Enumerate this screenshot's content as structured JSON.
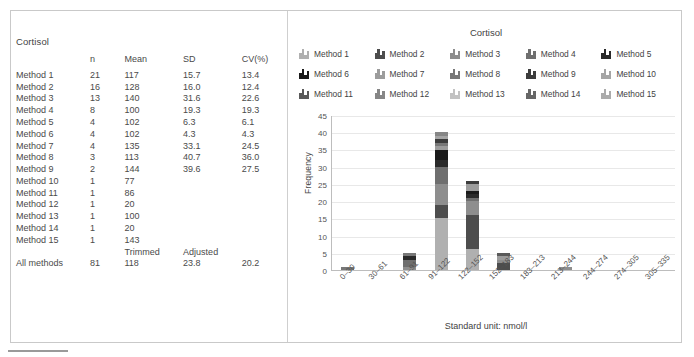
{
  "analyte": "Cortisol",
  "table": {
    "title": "Cortisol",
    "headers": {
      "label": "",
      "n": "n",
      "mean": "Mean",
      "sd": "SD",
      "cv": "CV(%)"
    },
    "rows": [
      {
        "label": "Method 1",
        "n": "21",
        "mean": "117",
        "sd": "15.7",
        "cv": "13.4"
      },
      {
        "label": "Method 2",
        "n": "16",
        "mean": "128",
        "sd": "16.0",
        "cv": "12.4"
      },
      {
        "label": "Method 3",
        "n": "13",
        "mean": "140",
        "sd": "31.6",
        "cv": "22.6"
      },
      {
        "label": "Method 4",
        "n": "8",
        "mean": "100",
        "sd": "19.3",
        "cv": "19.3"
      },
      {
        "label": "Method 5",
        "n": "4",
        "mean": "102",
        "sd": "6.3",
        "cv": "6.1"
      },
      {
        "label": "Method 6",
        "n": "4",
        "mean": "102",
        "sd": "4.3",
        "cv": "4.3"
      },
      {
        "label": "Method 7",
        "n": "4",
        "mean": "135",
        "sd": "33.1",
        "cv": "24.5"
      },
      {
        "label": "Method 8",
        "n": "3",
        "mean": "113",
        "sd": "40.7",
        "cv": "36.0"
      },
      {
        "label": "Method 9",
        "n": "2",
        "mean": "144",
        "sd": "39.6",
        "cv": "27.5"
      },
      {
        "label": "Method 10",
        "n": "1",
        "mean": "77",
        "sd": "",
        "cv": ""
      },
      {
        "label": "Method 11",
        "n": "1",
        "mean": "86",
        "sd": "",
        "cv": ""
      },
      {
        "label": "Method 12",
        "n": "1",
        "mean": "20",
        "sd": "",
        "cv": ""
      },
      {
        "label": "Method 13",
        "n": "1",
        "mean": "100",
        "sd": "",
        "cv": ""
      },
      {
        "label": "Method 14",
        "n": "1",
        "mean": "20",
        "sd": "",
        "cv": ""
      },
      {
        "label": "Method 15",
        "n": "1",
        "mean": "143",
        "sd": "",
        "cv": ""
      }
    ],
    "subheader": {
      "label": "",
      "n": "",
      "mean": "Trimmed",
      "sd": "Adjusted",
      "cv": ""
    },
    "total": {
      "label": "All methods",
      "n": "81",
      "mean": "118",
      "sd": "23.8",
      "cv": "20.2"
    }
  },
  "chart_data": {
    "type": "bar",
    "subtype": "stacked-histogram",
    "title": "Cortisol",
    "xlabel": "Standard unit: nmol/l",
    "ylabel": "Frequency",
    "ylim": [
      0,
      45
    ],
    "yticks": [
      0,
      5,
      10,
      15,
      20,
      25,
      30,
      35,
      40,
      45
    ],
    "grid": true,
    "legend_position": "top",
    "categories": [
      "0–30",
      "30–61",
      "61–91",
      "91–122",
      "122–152",
      "152–183",
      "183–213",
      "213–244",
      "244–274",
      "274–305",
      "305–335"
    ],
    "totals": [
      1,
      0,
      5,
      40,
      26,
      5,
      0,
      1,
      0,
      0,
      0
    ],
    "series": [
      {
        "name": "Method 1",
        "color": "#b0b0b0",
        "values": [
          0,
          0,
          0,
          15,
          6,
          0,
          0,
          0,
          0,
          0,
          0
        ]
      },
      {
        "name": "Method 2",
        "color": "#4d4d4d",
        "values": [
          0,
          0,
          0,
          4,
          10,
          2,
          0,
          0,
          0,
          0,
          0
        ]
      },
      {
        "name": "Method 3",
        "color": "#8e8e8e",
        "values": [
          0,
          0,
          1,
          6,
          4,
          1,
          0,
          1,
          0,
          0,
          0
        ]
      },
      {
        "name": "Method 4",
        "color": "#6f6f6f",
        "values": [
          0,
          0,
          2,
          5,
          1,
          0,
          0,
          0,
          0,
          0,
          0
        ]
      },
      {
        "name": "Method 5",
        "color": "#2a2a2a",
        "values": [
          0,
          0,
          1,
          2,
          1,
          0,
          0,
          0,
          0,
          0,
          0
        ]
      },
      {
        "name": "Method 6",
        "color": "#1a1a1a",
        "values": [
          0,
          0,
          0,
          3,
          1,
          0,
          0,
          0,
          0,
          0,
          0
        ]
      },
      {
        "name": "Method 7",
        "color": "#9c9c9c",
        "values": [
          0,
          0,
          0,
          1,
          2,
          1,
          0,
          0,
          0,
          0,
          0
        ]
      },
      {
        "name": "Method 8",
        "color": "#787878",
        "values": [
          1,
          0,
          1,
          1,
          0,
          0,
          0,
          0,
          0,
          0,
          0
        ]
      },
      {
        "name": "Method 9",
        "color": "#3c3c3c",
        "values": [
          0,
          0,
          0,
          1,
          1,
          0,
          0,
          0,
          0,
          0,
          0
        ]
      },
      {
        "name": "Method 10",
        "color": "#a5a5a5",
        "values": [
          0,
          0,
          0,
          1,
          0,
          0,
          0,
          0,
          0,
          0,
          0
        ]
      },
      {
        "name": "Method 11",
        "color": "#5a5a5a",
        "values": [
          0,
          0,
          0,
          0,
          0,
          1,
          0,
          0,
          0,
          0,
          0
        ]
      },
      {
        "name": "Method 12",
        "color": "#868686",
        "values": [
          0,
          0,
          0,
          1,
          0,
          0,
          0,
          0,
          0,
          0,
          0
        ]
      },
      {
        "name": "Method 13",
        "color": "#c2c2c2",
        "values": [
          0,
          0,
          0,
          0,
          0,
          0,
          0,
          0,
          0,
          0,
          0
        ]
      },
      {
        "name": "Method 14",
        "color": "#666666",
        "values": [
          0,
          0,
          0,
          0,
          0,
          0,
          0,
          0,
          0,
          0,
          0
        ]
      },
      {
        "name": "Method 15",
        "color": "#ababab",
        "values": [
          0,
          0,
          0,
          0,
          0,
          0,
          0,
          0,
          0,
          0,
          0
        ]
      }
    ]
  },
  "legend": {
    "title": "Cortisol",
    "items": [
      {
        "label": "Method 1",
        "color": "#b0b0b0"
      },
      {
        "label": "Method 2",
        "color": "#4d4d4d"
      },
      {
        "label": "Method 3",
        "color": "#8e8e8e"
      },
      {
        "label": "Method 4",
        "color": "#6f6f6f"
      },
      {
        "label": "Method 5",
        "color": "#2a2a2a"
      },
      {
        "label": "Method 6",
        "color": "#1a1a1a"
      },
      {
        "label": "Method 7",
        "color": "#9c9c9c"
      },
      {
        "label": "Method 8",
        "color": "#787878"
      },
      {
        "label": "Method 9",
        "color": "#3c3c3c"
      },
      {
        "label": "Method 10",
        "color": "#a5a5a5"
      },
      {
        "label": "Method 11",
        "color": "#5a5a5a"
      },
      {
        "label": "Method 12",
        "color": "#868686"
      },
      {
        "label": "Method 13",
        "color": "#c2c2c2"
      },
      {
        "label": "Method 14",
        "color": "#666666"
      },
      {
        "label": "Method 15",
        "color": "#ababab"
      }
    ]
  },
  "caption": ""
}
